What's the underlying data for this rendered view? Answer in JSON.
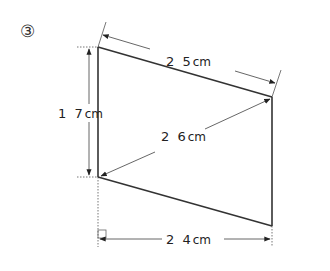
{
  "problem": {
    "marker": "③"
  },
  "diagram": {
    "shape": "quadrilateral (trapezoid with two vertical sides)",
    "labels": {
      "top_side": "2 5",
      "left_side": "1 7",
      "diagonal": "2 6",
      "base": "2 4",
      "unit": "cm"
    },
    "measurements": {
      "top_side_cm": 25,
      "left_side_cm": 17,
      "diagonal_cm": 26,
      "horizontal_distance_cm": 24
    },
    "right_angle_marker": true,
    "colors": {
      "shape_line": "#333333",
      "dimension_line": "#555555",
      "extension_line": "#777777"
    }
  }
}
